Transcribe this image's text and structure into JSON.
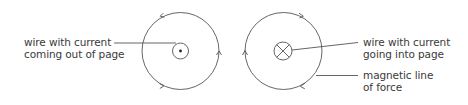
{
  "diagram": {
    "left": {
      "label_line1": "wire with current",
      "label_line2": "coming out of page",
      "wire_symbol": "dot-out-of-page",
      "field_direction": "counterclockwise"
    },
    "right": {
      "wire_label_line1": "wire with current",
      "wire_label_line2": "going into page",
      "wire_symbol": "cross-into-page",
      "field_direction": "clockwise",
      "field_label_line1": "magnetic line",
      "field_label_line2": "of force"
    },
    "colors": {
      "stroke": "#555555",
      "text": "#3a3a3a",
      "background": "#ffffff"
    }
  }
}
